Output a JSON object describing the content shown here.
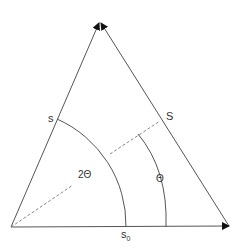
{
  "diagram": {
    "type": "triangle-angle-diagram",
    "labels": {
      "s": "s",
      "S": "S",
      "s0_base": "s",
      "s0_sub": "0",
      "two_theta": "2Θ",
      "theta": "Θ"
    },
    "colors": {
      "line": "#555555",
      "dashed": "#888888",
      "arrow": "#111111",
      "text": "#333333"
    }
  }
}
